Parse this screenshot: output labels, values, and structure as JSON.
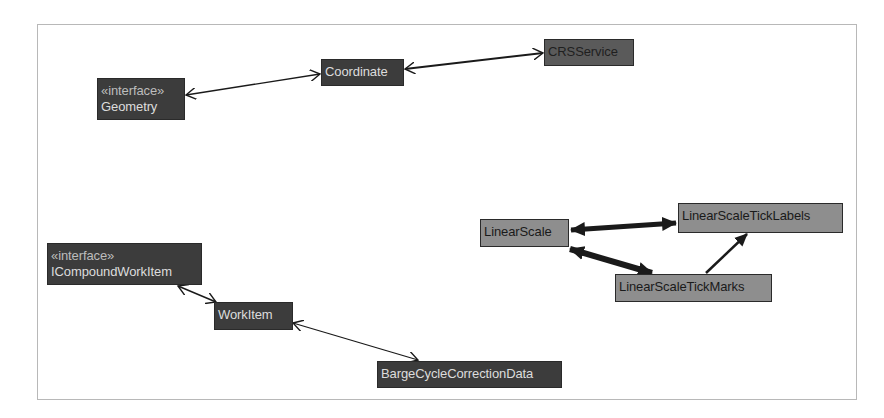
{
  "diagram": {
    "type": "class-dependency-graph",
    "frame": {
      "border_color": "#b8b8b8",
      "background": "#ffffff"
    },
    "colors": {
      "dark_node_bg": "#3c3c3c",
      "dark_node_text": "#dcdcdc",
      "dark_text_node_bg": "#5a5a5a",
      "dark_text_node_text": "#1f1f1f",
      "highlight_node_bg": "#8e8e8e",
      "highlight_node_text": "#1a1a1a",
      "edge": "#1a1a1a"
    },
    "nodes": [
      {
        "id": "geometry",
        "stereotype": "«interface»",
        "label": "Geometry",
        "x": 97,
        "y": 78,
        "w": 88,
        "h": 42,
        "style": "dark"
      },
      {
        "id": "coordinate",
        "stereotype": null,
        "label": "Coordinate",
        "x": 321,
        "y": 59,
        "w": 83,
        "h": 27,
        "style": "dark"
      },
      {
        "id": "crsservice",
        "stereotype": null,
        "label": "CRSService",
        "x": 544,
        "y": 39,
        "w": 90,
        "h": 27,
        "style": "darktext"
      },
      {
        "id": "linearscale",
        "stereotype": null,
        "label": "LinearScale",
        "x": 480,
        "y": 219,
        "w": 89,
        "h": 28,
        "style": "mid"
      },
      {
        "id": "linearscaleticklabels",
        "stereotype": null,
        "label": "LinearScaleTickLabels",
        "x": 678,
        "y": 203,
        "w": 165,
        "h": 30,
        "style": "mid"
      },
      {
        "id": "linearscaletickmarks",
        "stereotype": null,
        "label": "LinearScaleTickMarks",
        "x": 615,
        "y": 274,
        "w": 157,
        "h": 28,
        "style": "mid"
      },
      {
        "id": "icompoundworkitem",
        "stereotype": "«interface»",
        "label": "ICompoundWorkItem",
        "x": 47,
        "y": 243,
        "w": 155,
        "h": 42,
        "style": "dark"
      },
      {
        "id": "workitem",
        "stereotype": null,
        "label": "WorkItem",
        "x": 214,
        "y": 302,
        "w": 79,
        "h": 28,
        "style": "dark"
      },
      {
        "id": "bargecyclecorrectiondata",
        "stereotype": null,
        "label": "BargeCycleCorrectionData",
        "x": 377,
        "y": 361,
        "w": 185,
        "h": 27,
        "style": "dark"
      }
    ],
    "edges": [
      {
        "from": "geometry",
        "to": "coordinate",
        "direction": "both",
        "head": "open",
        "weight": 1.3
      },
      {
        "from": "coordinate",
        "to": "crsservice",
        "direction": "both",
        "head": "open",
        "weight": 2
      },
      {
        "from": "linearscale",
        "to": "linearscaleticklabels",
        "direction": "both",
        "head": "filled",
        "weight": 5
      },
      {
        "from": "linearscale",
        "to": "linearscaletickmarks",
        "direction": "both",
        "head": "filled",
        "weight": 6
      },
      {
        "from": "linearscaletickmarks",
        "to": "linearscaleticklabels",
        "direction": "forward",
        "head": "filled",
        "weight": 2.5
      },
      {
        "from": "icompoundworkitem",
        "to": "workitem",
        "direction": "both",
        "head": "open",
        "weight": 1.5
      },
      {
        "from": "workitem",
        "to": "bargecyclecorrectiondata",
        "direction": "both",
        "head": "open",
        "weight": 1.3
      }
    ]
  }
}
